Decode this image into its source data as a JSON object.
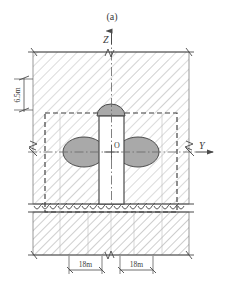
{
  "figure": {
    "caption": "(a)",
    "type": "engineering-cross-section"
  },
  "axes": {
    "vertical": {
      "label": "Z",
      "direction": "up"
    },
    "horizontal": {
      "label": "Y",
      "direction": "right"
    },
    "origin": {
      "label": "O"
    }
  },
  "dimensions": [
    {
      "name": "depth-to-crown",
      "value": "6.5m",
      "orientation": "vertical",
      "side": "left"
    },
    {
      "name": "left-span",
      "value": "18m",
      "orientation": "horizontal",
      "side": "bottom-left"
    },
    {
      "name": "right-span",
      "value": "18m",
      "orientation": "horizontal",
      "side": "bottom-right"
    }
  ],
  "regions": [
    {
      "name": "upper-soil-layer",
      "hatch": "diagonal-light",
      "color": "#9a9a9a"
    },
    {
      "name": "lower-rock-layer",
      "hatch": "diagonal-dense",
      "color": "#8d8d8d"
    },
    {
      "name": "bedrock-boundary",
      "symbol": "arc-hatch"
    }
  ],
  "structures": [
    {
      "name": "vertical-shaft",
      "fill": "#ffffff",
      "stroke": "#4a4a4a"
    },
    {
      "name": "top-chamber",
      "shape": "half-ellipse",
      "fill": "#a8a8a8"
    },
    {
      "name": "left-chamber",
      "shape": "ellipse",
      "fill": "#a8a8a8"
    },
    {
      "name": "right-chamber",
      "shape": "ellipse",
      "fill": "#a8a8a8"
    }
  ],
  "boundary": {
    "name": "model-boundary",
    "style": "dashed",
    "color": "#3c3c3c"
  },
  "break_symbols": [
    {
      "name": "break-top",
      "position": "top-center"
    },
    {
      "name": "break-left",
      "position": "left-middle"
    },
    {
      "name": "break-right",
      "position": "right-middle"
    },
    {
      "name": "break-bottom",
      "position": "bottom-center"
    }
  ],
  "colors": {
    "line": "#4a4a4a",
    "hatch": "#a0a0a0",
    "chamber_fill": "#a9a9a9",
    "text": "#3a3a3a",
    "dashed": "#3c3c3c"
  }
}
